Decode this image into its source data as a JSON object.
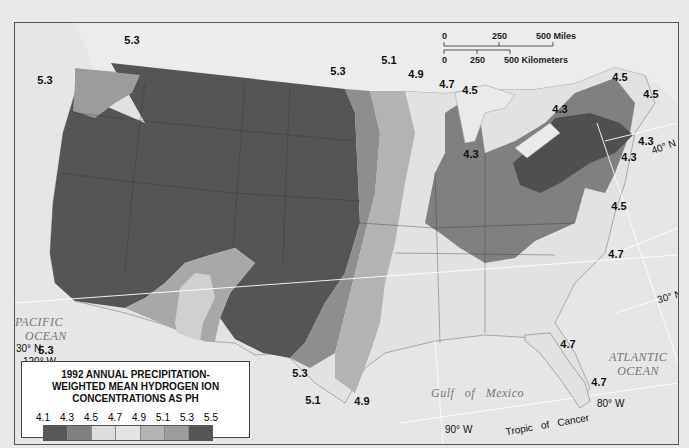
{
  "legend": {
    "title_lines": [
      "1992 ANNUAL PRECIPITATION-",
      "WEIGHTED MEAN HYDROGEN ION",
      "CONCENTRATIONS AS PH"
    ],
    "ticks": [
      "4.1",
      "4.3",
      "4.5",
      "4.7",
      "4.9",
      "5.1",
      "5.3",
      "5.5"
    ],
    "bins": [
      {
        "range": "4.1-4.3",
        "color": "#575757"
      },
      {
        "range": "4.3-4.5",
        "color": "#7f7f7f"
      },
      {
        "range": "4.5-4.7",
        "color": "#dcdcdc"
      },
      {
        "range": "4.7-4.9",
        "color": "#e4e4e4"
      },
      {
        "range": "4.9-5.1",
        "color": "#b3b3b3"
      },
      {
        "range": "5.1-5.3",
        "color": "#9c9c9c"
      },
      {
        "range": "5.3-5.5",
        "color": "#555555"
      }
    ]
  },
  "scale_bar": {
    "miles_ticks": [
      "0",
      "250",
      "500 Miles"
    ],
    "km_ticks": [
      "0",
      "250",
      "500 Kilometers"
    ]
  },
  "oceans": {
    "pacific": [
      "PACIFIC",
      "OCEAN"
    ],
    "atlantic": [
      "ATLANTIC",
      "OCEAN"
    ],
    "gulf": "Gulf   of   Mexico"
  },
  "graticule_labels": {
    "lat30_west": "30° N",
    "lon120": "120° W",
    "lat40_east": "40° N",
    "lat30_east": "30° N",
    "lon90": "90° W",
    "lon80": "80° W",
    "tropic": "Tropic   of   Cancer"
  },
  "isoline_labels": [
    {
      "value": "5.3",
      "x": 117,
      "y": 17
    },
    {
      "value": "5.3",
      "x": 30,
      "y": 57
    },
    {
      "value": "5.3",
      "x": 323,
      "y": 48
    },
    {
      "value": "5.1",
      "x": 374,
      "y": 37
    },
    {
      "value": "4.9",
      "x": 401,
      "y": 51
    },
    {
      "value": "4.7",
      "x": 432,
      "y": 61
    },
    {
      "value": "4.5",
      "x": 455,
      "y": 67
    },
    {
      "value": "4.5",
      "x": 605,
      "y": 54
    },
    {
      "value": "4.5",
      "x": 636,
      "y": 71
    },
    {
      "value": "4.3",
      "x": 545,
      "y": 86
    },
    {
      "value": "4.3",
      "x": 631,
      "y": 118
    },
    {
      "value": "4.3",
      "x": 614,
      "y": 134
    },
    {
      "value": "4.3",
      "x": 456,
      "y": 131
    },
    {
      "value": "4.5",
      "x": 604,
      "y": 183
    },
    {
      "value": "4.7",
      "x": 601,
      "y": 231
    },
    {
      "value": "5.3",
      "x": 31,
      "y": 327
    },
    {
      "value": "5.1",
      "x": 150,
      "y": 348
    },
    {
      "value": "5.1",
      "x": 184,
      "y": 348
    },
    {
      "value": "5.3",
      "x": 206,
      "y": 348
    },
    {
      "value": "5.3",
      "x": 285,
      "y": 350
    },
    {
      "value": "5.1",
      "x": 298,
      "y": 377
    },
    {
      "value": "4.9",
      "x": 347,
      "y": 378
    },
    {
      "value": "4.7",
      "x": 553,
      "y": 321
    },
    {
      "value": "4.7",
      "x": 584,
      "y": 359
    }
  ]
}
